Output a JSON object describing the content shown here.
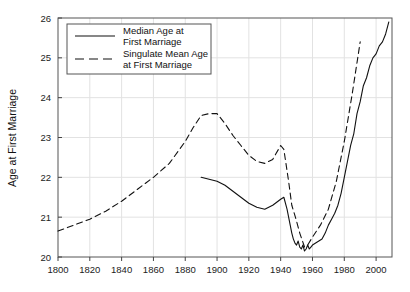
{
  "chart_data": {
    "type": "line",
    "title": "",
    "xlabel": "",
    "ylabel": "Age at First Marriage",
    "xlim": [
      1800,
      2010
    ],
    "ylim": [
      20,
      26
    ],
    "grid": true,
    "legend_position": "top-left",
    "xticks": [
      1800,
      1820,
      1840,
      1860,
      1880,
      1900,
      1920,
      1940,
      1960,
      1980,
      2000
    ],
    "yticks": [
      20,
      21,
      22,
      23,
      24,
      25,
      26
    ],
    "xtick_labels": [
      "1800",
      "1820",
      "1840",
      "1860",
      "1880",
      "1900",
      "1920",
      "1940",
      "1960",
      "1980",
      "2000"
    ],
    "ytick_labels": [
      "20",
      "21",
      "22",
      "23",
      "24",
      "25",
      "26"
    ],
    "series": [
      {
        "name": "Median Age at First Marriage",
        "style": "solid",
        "color": "#111111",
        "x": [
          1890,
          1895,
          1900,
          1905,
          1910,
          1915,
          1920,
          1925,
          1930,
          1935,
          1940,
          1942,
          1944,
          1946,
          1947,
          1948,
          1949,
          1950,
          1951,
          1952,
          1953,
          1954,
          1955,
          1956,
          1957,
          1958,
          1959,
          1960,
          1962,
          1964,
          1966,
          1968,
          1970,
          1972,
          1974,
          1976,
          1978,
          1980,
          1982,
          1984,
          1986,
          1988,
          1990,
          1992,
          1994,
          1996,
          1998,
          2000,
          2002,
          2004,
          2006,
          2008
        ],
        "values": [
          22.0,
          21.95,
          21.9,
          21.8,
          21.65,
          21.5,
          21.35,
          21.25,
          21.2,
          21.3,
          21.45,
          21.5,
          21.2,
          20.8,
          20.6,
          20.45,
          20.35,
          20.3,
          20.4,
          20.25,
          20.2,
          20.3,
          20.15,
          20.2,
          20.3,
          20.2,
          20.25,
          20.3,
          20.35,
          20.4,
          20.45,
          20.6,
          20.8,
          20.95,
          21.1,
          21.3,
          21.6,
          22.0,
          22.4,
          22.8,
          23.1,
          23.6,
          23.9,
          24.3,
          24.5,
          24.8,
          25.0,
          25.1,
          25.3,
          25.4,
          25.6,
          25.9
        ]
      },
      {
        "name": "Singulate Mean Age at First Marriage",
        "style": "dashed",
        "color": "#111111",
        "x": [
          1800,
          1810,
          1820,
          1830,
          1840,
          1850,
          1860,
          1870,
          1880,
          1885,
          1890,
          1895,
          1900,
          1905,
          1910,
          1915,
          1920,
          1925,
          1930,
          1935,
          1940,
          1942,
          1945,
          1947,
          1950,
          1952,
          1955,
          1957,
          1960,
          1965,
          1970,
          1975,
          1980,
          1985,
          1990
        ],
        "values": [
          20.65,
          20.8,
          20.95,
          21.15,
          21.4,
          21.7,
          22.0,
          22.35,
          22.9,
          23.25,
          23.55,
          23.6,
          23.6,
          23.35,
          23.05,
          22.8,
          22.55,
          22.4,
          22.35,
          22.45,
          22.8,
          22.7,
          21.9,
          21.3,
          20.9,
          20.6,
          20.25,
          20.3,
          20.5,
          20.8,
          21.2,
          21.9,
          22.9,
          24.1,
          25.4
        ]
      }
    ],
    "legend": [
      {
        "label_line1": "Median Age at",
        "label_line2": "First Marriage",
        "style": "solid"
      },
      {
        "label_line1": "Singulate Mean Age",
        "label_line2": "at First Marriage",
        "style": "dashed"
      }
    ]
  }
}
